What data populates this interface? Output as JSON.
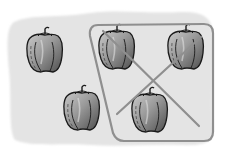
{
  "illustration": {
    "description": "Subtraction picture: five bell peppers, three circled and crossed out",
    "total_items": 5,
    "crossed_out_items": 3,
    "remaining_items": 2,
    "item_type": "bell pepper",
    "colors": {
      "background_blob": "#e4e4e4",
      "pepper_fill_light": "#b8b8b8",
      "pepper_fill_dark": "#5a5a5a",
      "pepper_outline": "#1a1a1a",
      "enclosure_stroke": "#8f8f8f",
      "cross_stroke": "#8f8f8f"
    },
    "peppers": [
      {
        "id": "pepper-1",
        "x": 45,
        "y": 50,
        "crossed": false
      },
      {
        "id": "pepper-2",
        "x": 117,
        "y": 47,
        "crossed": true
      },
      {
        "id": "pepper-3",
        "x": 186,
        "y": 47,
        "crossed": true
      },
      {
        "id": "pepper-4",
        "x": 82,
        "y": 108,
        "crossed": false
      },
      {
        "id": "pepper-5",
        "x": 150,
        "y": 110,
        "crossed": true
      }
    ]
  }
}
